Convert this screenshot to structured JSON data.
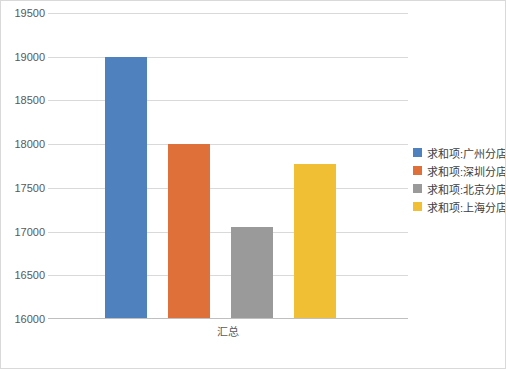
{
  "chart_data": {
    "type": "bar",
    "title": "",
    "subtitle": "",
    "xlabel": "",
    "ylabel": "",
    "categories": [
      "汇总"
    ],
    "category_label": "汇总",
    "ylim": [
      16000,
      19500
    ],
    "yticks": [
      "16000",
      "16500",
      "17000",
      "17500",
      "18000",
      "18500",
      "19000",
      "19500"
    ],
    "ytick_values": [
      16000,
      16500,
      17000,
      17500,
      18000,
      18500,
      19000,
      19500
    ],
    "grid": true,
    "legend_position": "right",
    "series": [
      {
        "name": "求和项:广州分店",
        "values": [
          19000
        ],
        "color": "#4e81bd"
      },
      {
        "name": "求和项:深圳分店",
        "values": [
          18000
        ],
        "color": "#e0703a"
      },
      {
        "name": "求和项:北京分店",
        "values": [
          17050
        ],
        "color": "#9a9a9a"
      },
      {
        "name": "求和项:上海分店",
        "values": [
          17770
        ],
        "color": "#f0bf34"
      }
    ]
  }
}
